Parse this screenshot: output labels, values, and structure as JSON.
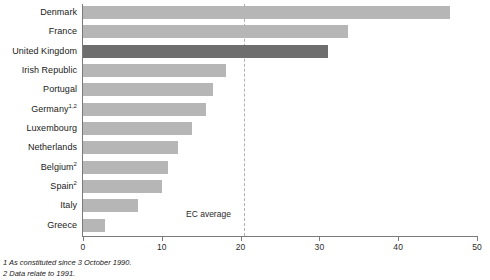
{
  "chart_data": {
    "type": "bar",
    "orientation": "horizontal",
    "title": "",
    "xlabel": "",
    "ylabel": "",
    "xlim": [
      0,
      50
    ],
    "xticks": [
      0,
      10,
      20,
      30,
      40,
      50
    ],
    "xtick_labels": [
      "0",
      "10",
      "20",
      "30",
      "40",
      "50"
    ],
    "grid": false,
    "legend": "none",
    "categories": [
      "Denmark",
      "France",
      "United Kingdom",
      "Irish Republic",
      "Portugal",
      "Germany",
      "Luxembourg",
      "Netherlands",
      "Belgium",
      "Spain",
      "Italy",
      "Greece"
    ],
    "values": [
      46.6,
      33.6,
      31.1,
      18.1,
      16.5,
      15.6,
      13.8,
      12.1,
      10.8,
      10.0,
      7.0,
      2.8
    ],
    "bars": [
      {
        "label": "Denmark",
        "superscript": "",
        "value": 46.6,
        "highlight": false
      },
      {
        "label": "France",
        "superscript": "",
        "value": 33.6,
        "highlight": false
      },
      {
        "label": "United Kingdom",
        "superscript": "",
        "value": 31.1,
        "highlight": true
      },
      {
        "label": "Irish Republic",
        "superscript": "",
        "value": 18.1,
        "highlight": false
      },
      {
        "label": "Portugal",
        "superscript": "",
        "value": 16.5,
        "highlight": false
      },
      {
        "label": "Germany",
        "superscript": "1,2",
        "value": 15.6,
        "highlight": false
      },
      {
        "label": "Luxembourg",
        "superscript": "",
        "value": 13.8,
        "highlight": false
      },
      {
        "label": "Netherlands",
        "superscript": "",
        "value": 12.1,
        "highlight": false
      },
      {
        "label": "Belgium",
        "superscript": "2",
        "value": 10.8,
        "highlight": false
      },
      {
        "label": "Spain",
        "superscript": "2",
        "value": 10.0,
        "highlight": false
      },
      {
        "label": "Italy",
        "superscript": "",
        "value": 7.0,
        "highlight": false
      },
      {
        "label": "Greece",
        "superscript": "",
        "value": 2.8,
        "highlight": false
      }
    ],
    "annotations": [
      {
        "name": "ec-average",
        "label": "EC average",
        "value": 20,
        "style": "dashed-vertical-line"
      }
    ],
    "colors": {
      "bar": "#b6b6b6",
      "bar_highlight": "#6e6e6e",
      "axis": "#7a7a7a",
      "reference_line": "#b0b0b0",
      "text": "#1a1a1a",
      "background": "#ffffff"
    }
  },
  "footnotes": [
    "1  As constituted since 3 October 1990.",
    "2  Data relate to 1991."
  ]
}
